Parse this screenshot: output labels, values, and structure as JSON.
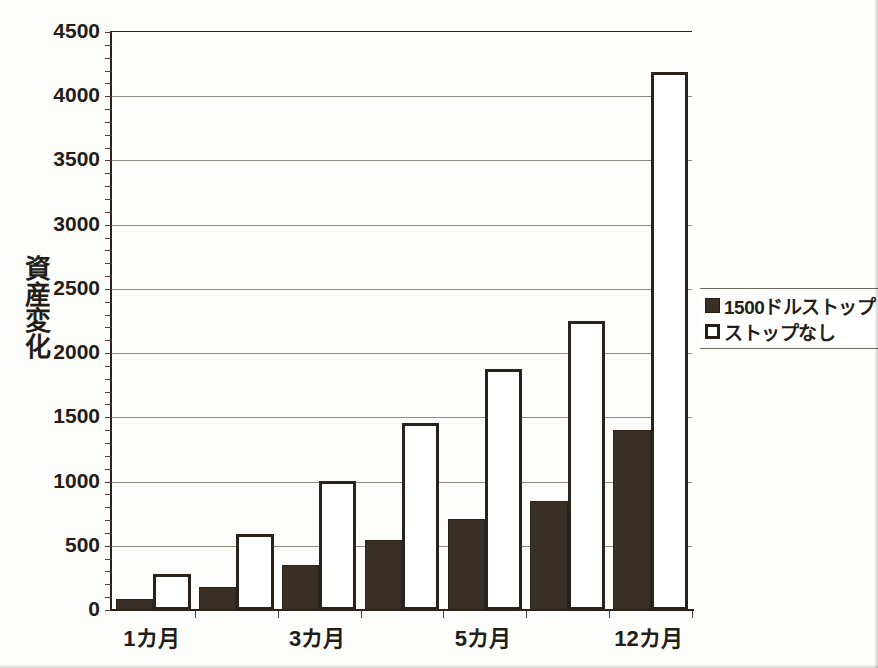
{
  "chart_data": {
    "type": "bar",
    "title": "",
    "xlabel": "",
    "ylabel": "資産変化",
    "ylim": [
      0,
      4500
    ],
    "ytick_step": 500,
    "yticks": [
      0,
      500,
      1000,
      1500,
      2000,
      2500,
      3000,
      3500,
      4000,
      4500
    ],
    "ytick_labels": [
      "0",
      "500",
      "1000",
      "1500",
      "2000",
      "2500",
      "3000",
      "3500",
      "4000",
      "4500"
    ],
    "grid": true,
    "grid_axis": "y",
    "legend_position": "right",
    "categories": [
      "1カ月",
      "2カ月",
      "3カ月",
      "4カ月",
      "5カ月",
      "6カ月",
      "12カ月"
    ],
    "visible_category_labels": [
      "1カ月",
      "3カ月",
      "5カ月",
      "12カ月"
    ],
    "visible_category_indices": [
      0,
      2,
      4,
      6
    ],
    "series": [
      {
        "name": "1500ドルストップ",
        "style": "filled",
        "color": "#3a2f25",
        "values": [
          85,
          180,
          350,
          545,
          710,
          850,
          1400
        ]
      },
      {
        "name": "ストップなし",
        "style": "hollow",
        "color": "#ffffff",
        "edge_color": "#2a221b",
        "values": [
          280,
          590,
          1005,
          1455,
          1880,
          2250,
          4185
        ]
      }
    ]
  },
  "legend": {
    "entries": [
      {
        "label": "1500ドルストップ",
        "swatch": "filled-square-swatch"
      },
      {
        "label": "ストップなし",
        "swatch": "hollow-square-swatch"
      }
    ]
  },
  "colors": {
    "bar_fill": "#3a2f25",
    "bar_edge": "#2a221b",
    "axis": "#2a221b",
    "gridline": "#8d8a84",
    "text": "#241c16",
    "background": "#fdfdfc"
  }
}
